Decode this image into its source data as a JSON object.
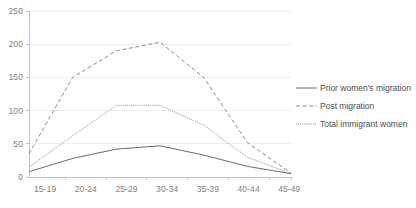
{
  "chart_data": {
    "type": "line",
    "title": "",
    "xlabel": "",
    "ylabel": "",
    "categories": [
      "15-19",
      "20-24",
      "25-29",
      "30-34",
      "35-39",
      "40-44",
      "45-49"
    ],
    "ylim": [
      0,
      250
    ],
    "yticks": [
      0,
      50,
      100,
      150,
      200,
      250
    ],
    "grid": true,
    "legend_position": "right",
    "series": [
      {
        "name": "Prior women's migration",
        "style": "solid",
        "color": "#595959",
        "values": [
          8,
          28,
          42,
          47,
          33,
          16,
          5
        ]
      },
      {
        "name": "Post migration",
        "style": "dashed",
        "color": "#7f7f7f",
        "values": [
          35,
          150,
          190,
          203,
          150,
          52,
          6
        ]
      },
      {
        "name": "Total immigrant women",
        "style": "dotted",
        "color": "#7f7f7f",
        "values": [
          15,
          62,
          108,
          108,
          78,
          30,
          5
        ]
      }
    ]
  },
  "yaxis": {
    "labels": [
      "250",
      "200",
      "150",
      "100",
      "50",
      "0"
    ]
  },
  "xaxis": {
    "labels": [
      "15-19",
      "20-24",
      "25-29",
      "30-34",
      "35-39",
      "40-44",
      "45-49"
    ]
  },
  "legend": {
    "items": [
      {
        "label": "Prior women's migration"
      },
      {
        "label": "Post migration"
      },
      {
        "label": "Total immigrant women"
      }
    ]
  }
}
